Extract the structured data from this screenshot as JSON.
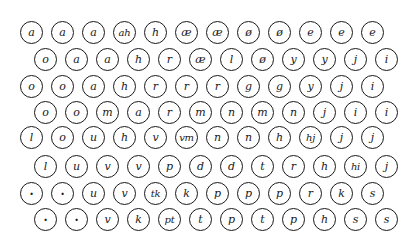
{
  "grid": {
    "rows": [
      [
        "a",
        "a",
        "a",
        "ah",
        "h",
        "æ",
        "æ",
        "ø",
        "ø",
        "e",
        "e",
        "e"
      ],
      [
        "o",
        "a",
        "a",
        "h",
        "r",
        "æ",
        "l",
        "ø",
        "y",
        "y",
        "j",
        "i"
      ],
      [
        "o",
        "o",
        "a",
        "h",
        "r",
        "r",
        "r",
        "g",
        "g",
        "y",
        "j",
        "i"
      ],
      [
        "o",
        "o",
        "m",
        "a",
        "r",
        "m",
        "n",
        "m",
        "n",
        "j",
        "i",
        "i"
      ],
      [
        "l",
        "o",
        "u",
        "h",
        "v",
        "vm",
        "n",
        "n",
        "h",
        "hj",
        "j",
        "j"
      ],
      [
        "l",
        "u",
        "v",
        "v",
        "p",
        "d",
        "d",
        "t",
        "r",
        "h",
        "hi",
        "j"
      ],
      [
        "·",
        "·",
        "u",
        "v",
        "tk",
        "k",
        "p",
        "p",
        "p",
        "r",
        "k",
        "s"
      ],
      [
        "·",
        "·",
        "v",
        "k",
        "pt",
        "t",
        "p",
        "t",
        "p",
        "h",
        "s",
        "s"
      ]
    ]
  }
}
